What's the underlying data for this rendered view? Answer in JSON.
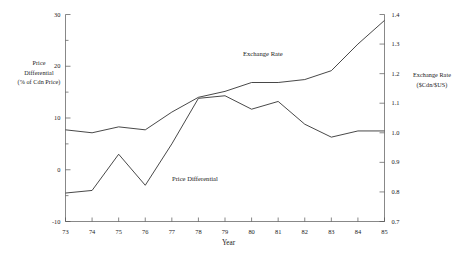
{
  "chart_data": {
    "type": "line",
    "title": "",
    "xlabel": "Year",
    "x": [
      73,
      74,
      75,
      76,
      77,
      78,
      79,
      80,
      81,
      82,
      83,
      84,
      85
    ],
    "xtick_labels": [
      "73",
      "74",
      "75",
      "76",
      "77",
      "78",
      "79",
      "80",
      "81",
      "82",
      "83",
      "84",
      "85"
    ],
    "grid": false,
    "legend_position": "inline-annotations",
    "axes": {
      "left": {
        "label": "Price Differential (% of Cdn Price)",
        "label_lines": [
          "Price",
          "Differential",
          "(% of Cdn Price)"
        ],
        "ylim": [
          -10,
          30
        ],
        "ticks": [
          -10,
          0,
          10,
          20,
          30
        ],
        "tick_labels": [
          "-10",
          "0",
          "10",
          "20",
          "30"
        ]
      },
      "right": {
        "label": "Exchange Rate ($Cdn/$US)",
        "label_lines": [
          "Exchange Rate",
          "($Cdn/$US)"
        ],
        "ylim": [
          0.7,
          1.4
        ],
        "ticks": [
          0.7,
          0.8,
          0.9,
          1.0,
          1.1,
          1.2,
          1.3,
          1.4
        ],
        "tick_labels": [
          "0.7",
          "0.8",
          "0.9",
          "1.0",
          "1.1",
          "1.2",
          "1.3",
          "1.4"
        ]
      }
    },
    "series": [
      {
        "name": "Price Differential",
        "axis": "left",
        "annotation": "Price Differential",
        "color": "#333333",
        "values": [
          -4.5,
          -4.0,
          3.0,
          -3.0,
          5.0,
          13.8,
          14.3,
          11.7,
          13.2,
          8.8,
          6.3,
          7.5,
          7.5
        ]
      },
      {
        "name": "Exchange Rate",
        "axis": "right",
        "annotation": "Exchange Rate",
        "color": "#333333",
        "values": [
          1.01,
          1.0,
          1.02,
          1.01,
          1.07,
          1.12,
          1.14,
          1.17,
          1.17,
          1.18,
          1.21,
          1.3,
          1.38
        ]
      }
    ]
  }
}
